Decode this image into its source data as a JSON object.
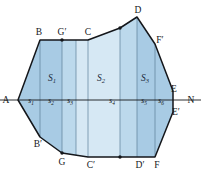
{
  "figure": {
    "type": "geometry-diagram",
    "colors": {
      "strip_dark": "#a8cbe4",
      "strip_light": "#d6e8f4",
      "strip_mid": "#bcd9ec",
      "outline": "#14161a",
      "chord": "#4a6d86",
      "axis": "#14161a",
      "label": "#14161a",
      "region_label": "#1b2a3a",
      "background": "#ffffff"
    },
    "vertices": [
      {
        "name": "A",
        "label": "A",
        "x": 18,
        "y": 100
      },
      {
        "name": "B",
        "label": "B",
        "x": 40,
        "y": 40
      },
      {
        "name": "Bp",
        "label": "B′",
        "x": 40,
        "y": 137
      },
      {
        "name": "C",
        "label": "C",
        "x": 88,
        "y": 40
      },
      {
        "name": "Cp",
        "label": "C′",
        "x": 88,
        "y": 157
      },
      {
        "name": "D",
        "label": "D",
        "x": 137,
        "y": 17
      },
      {
        "name": "Dp",
        "label": "D′",
        "x": 137,
        "y": 157
      },
      {
        "name": "E",
        "label": "E",
        "x": 173,
        "y": 91
      },
      {
        "name": "Ep",
        "label": "E′",
        "x": 173,
        "y": 112
      },
      {
        "name": "F",
        "label": "F",
        "x": 155,
        "y": 157
      },
      {
        "name": "Fp",
        "label": "F′",
        "x": 155,
        "y": 44
      },
      {
        "name": "G",
        "label": "G",
        "x": 62,
        "y": 153
      },
      {
        "name": "Gp",
        "label": "G′",
        "x": 62,
        "y": 40
      },
      {
        "name": "N",
        "label": "N",
        "x": 190,
        "y": 100
      }
    ],
    "regions": [
      {
        "name": "S1",
        "base": "S",
        "sub": "1",
        "x": 52,
        "y": 78
      },
      {
        "name": "S2",
        "base": "S",
        "sub": "2",
        "x": 101,
        "y": 78
      },
      {
        "name": "S3",
        "base": "S",
        "sub": "3",
        "x": 144,
        "y": 78
      }
    ],
    "segments": [
      {
        "name": "s1",
        "base": "s",
        "sub": "1",
        "x": 31,
        "y": 103
      },
      {
        "name": "s2",
        "base": "s",
        "sub": "2",
        "x": 51,
        "y": 103
      },
      {
        "name": "s3",
        "base": "s",
        "sub": "3",
        "x": 70,
        "y": 103
      },
      {
        "name": "s4",
        "base": "s",
        "sub": "4",
        "x": 112,
        "y": 103
      },
      {
        "name": "s5",
        "base": "s",
        "sub": "5",
        "x": 144,
        "y": 103
      },
      {
        "name": "s6",
        "base": "s",
        "sub": "6",
        "x": 161,
        "y": 103
      }
    ],
    "axis": {
      "label_left": "A",
      "label_right": "N",
      "y": 100,
      "x_start": 0,
      "x_end": 201
    }
  }
}
